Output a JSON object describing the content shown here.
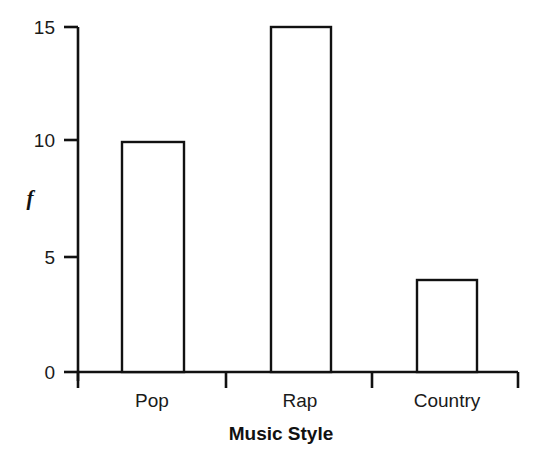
{
  "chart_data": {
    "type": "bar",
    "title": "",
    "categories": [
      "Pop",
      "Rap",
      "Country"
    ],
    "values": [
      10,
      15,
      4
    ],
    "series": [
      {
        "name": "f",
        "values": [
          10,
          15,
          4
        ]
      }
    ],
    "xlabel": "Music Style",
    "ylabel": "f",
    "ylim": [
      0,
      15
    ],
    "yticks": [
      0,
      5,
      10,
      15
    ],
    "ytick_labels": [
      "0",
      "5",
      "10",
      "15"
    ],
    "grid": false,
    "legend": false,
    "bar_fill_color": "#ffffff",
    "bar_edge_color": "#111111",
    "axis_color": "#111111",
    "background_color": "#ffffff"
  },
  "axes": {
    "y_title": "f",
    "x_title": "Music Style",
    "y_tick_labels": [
      "15",
      "10",
      "5",
      "0"
    ],
    "x_tick_labels": [
      "Pop",
      "Rap",
      "Country"
    ]
  },
  "bars": [
    {
      "label": "Pop",
      "value": 10,
      "value_label": "10"
    },
    {
      "label": "Rap",
      "value": 15,
      "value_label": "15"
    },
    {
      "label": "Country",
      "value": 4,
      "value_label": "4"
    }
  ]
}
